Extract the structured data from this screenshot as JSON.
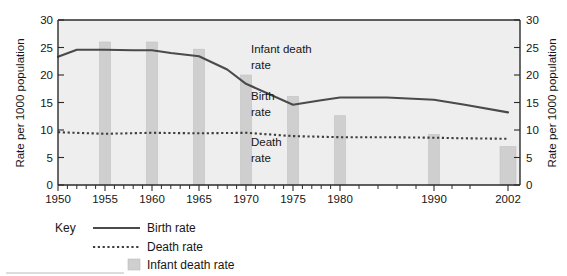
{
  "chart_data": {
    "type": "line",
    "title": "",
    "xlabel": "",
    "ylabel": "Rate per 1000 population",
    "ylabel_right": "Rate per 1000 population",
    "xlim": [
      1950,
      2002
    ],
    "ylim": [
      0,
      30
    ],
    "grid": false,
    "y_ticks": [
      0,
      5,
      10,
      15,
      20,
      25,
      30
    ],
    "y_tick_labels": [
      "0",
      "5",
      "10",
      "15",
      "20",
      "25",
      "30"
    ],
    "x_ticks": [
      1950,
      1955,
      1960,
      1965,
      1970,
      1975,
      1980,
      1990,
      2002
    ],
    "x_tick_labels": [
      "1950",
      "1955",
      "1960",
      "1965",
      "1970",
      "1975",
      "1980",
      "1990",
      "2002"
    ],
    "x_minor_ticks": [
      1951,
      1952,
      1953,
      1954,
      1956,
      1957,
      1958,
      1959,
      1961,
      1962,
      1963,
      1964,
      1966,
      1967,
      1968,
      1969,
      1971,
      1972,
      1973,
      1974,
      1976,
      1977,
      1978,
      1979,
      1982,
      1984,
      1986,
      1988,
      1994,
      1998
    ],
    "series": [
      {
        "name": "Birth rate",
        "style": "solid",
        "color": "#4a4a4a",
        "x": [
          1950,
          1952,
          1955,
          1958,
          1960,
          1962,
          1965,
          1968,
          1970,
          1975,
          1978,
          1980,
          1985,
          1990,
          1995,
          2002
        ],
        "values": [
          23.3,
          24.6,
          24.6,
          24.5,
          24.5,
          24.0,
          23.4,
          21.0,
          18.4,
          14.6,
          15.4,
          15.9,
          15.9,
          15.5,
          14.6,
          13.2
        ]
      },
      {
        "name": "Death rate",
        "style": "dotted",
        "color": "#3d3d3d",
        "x": [
          1950,
          1955,
          1960,
          1965,
          1970,
          1975,
          1980,
          1985,
          1990,
          1995,
          2002
        ],
        "values": [
          9.6,
          9.3,
          9.5,
          9.4,
          9.5,
          8.9,
          8.7,
          8.7,
          8.6,
          8.5,
          8.4
        ]
      },
      {
        "name": "Infant death rate",
        "style": "bar",
        "color": "#cfcfcf",
        "x": [
          1955,
          1960,
          1965,
          1970,
          1975,
          1980,
          1990,
          2002
        ],
        "values": [
          26.0,
          26.0,
          24.7,
          20.0,
          16.1,
          12.6,
          9.2,
          7.0
        ]
      }
    ],
    "annotations": [
      {
        "text_line1": "Infant death",
        "text_line2": "rate",
        "x": 1974,
        "y": 24.5
      },
      {
        "text_line1": "Birth",
        "text_line2": "rate",
        "x": 1974,
        "y": 17.0
      },
      {
        "text_line1": "Death",
        "text_line2": "rate",
        "x": 1974,
        "y": 9.0
      }
    ],
    "legend": {
      "position": "below-left",
      "title": "Key",
      "entries": [
        {
          "label": "Birth rate",
          "marker": "solid-line"
        },
        {
          "label": "Death rate",
          "marker": "dotted-line"
        },
        {
          "label": "Infant death rate",
          "marker": "filled-square"
        }
      ]
    }
  },
  "colors": {
    "plot_background": "#eeeeee",
    "bar_fill": "#cfcfcf",
    "birth_line": "#4a4a4a",
    "death_line": "#3d3d3d",
    "axis": "#2b2b2b",
    "text": "#161616",
    "page_background": "#ffffff"
  }
}
